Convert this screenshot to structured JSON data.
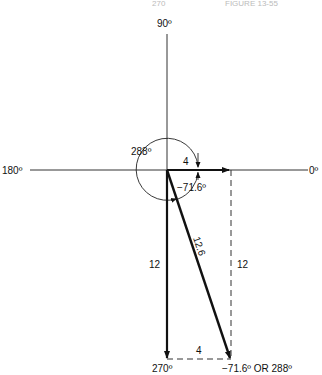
{
  "header": {
    "page": "270",
    "figure": "FIGURE 13-55"
  },
  "axes": {
    "top": "90º",
    "left": "180º",
    "right": "0º",
    "bottom": "270º"
  },
  "labels": {
    "angle_288": "288º",
    "horizontal_component": "4",
    "angle_neg": "−71.6º",
    "resultant": "12.6",
    "vertical_component": "12",
    "dashed_vertical": "12",
    "dashed_horizontal": "4",
    "tip": "−71.6º OR 288º"
  }
}
